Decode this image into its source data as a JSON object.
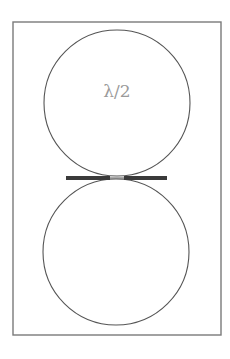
{
  "diagram": {
    "label": "λ/2",
    "colors": {
      "frame": "#7a7a7a",
      "circle": "#555555",
      "bar": "#3a3a3a",
      "label": "#9a9a9a",
      "background": "#ffffff"
    },
    "elements": {
      "frame": "rectangular border",
      "upper_loop": "circle (half-wavelength loop)",
      "lower_loop": "circle",
      "feed_bars": "horizontal thick bars meeting at junction with small gap"
    }
  }
}
